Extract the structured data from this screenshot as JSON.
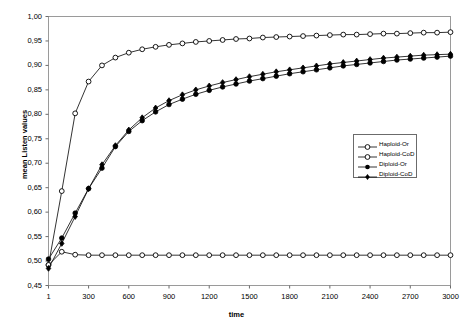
{
  "chart_data": {
    "type": "line",
    "title": "",
    "xlabel": "time",
    "ylabel": "mean Listen values",
    "xlim": [
      1,
      3000
    ],
    "ylim": [
      0.45,
      1.0
    ],
    "grid": false,
    "legend_position": "center-right",
    "xtick_labels": [
      "1",
      "300",
      "600",
      "900",
      "1200",
      "1500",
      "1800",
      "2100",
      "2400",
      "2700",
      "3000"
    ],
    "xtick_values": [
      1,
      300,
      600,
      900,
      1200,
      1500,
      1800,
      2100,
      2400,
      2700,
      3000
    ],
    "ytick_labels": [
      "0,45",
      "0,50",
      "0,55",
      "0,60",
      "0,65",
      "0,70",
      "0,75",
      "0,80",
      "0,85",
      "0,90",
      "0,95",
      "1,00"
    ],
    "ytick_values": [
      0.45,
      0.5,
      0.55,
      0.6,
      0.65,
      0.7,
      0.75,
      0.8,
      0.85,
      0.9,
      0.95,
      1.0
    ],
    "decimal_separator": ",",
    "marker_interval": 100,
    "x": [
      1,
      100,
      200,
      300,
      400,
      500,
      600,
      700,
      800,
      900,
      1000,
      1100,
      1200,
      1300,
      1400,
      1500,
      1600,
      1700,
      1800,
      1900,
      2000,
      2100,
      2200,
      2300,
      2400,
      2500,
      2600,
      2700,
      2800,
      2900,
      3000
    ],
    "series": [
      {
        "name": "Haploid-Or",
        "marker": "open-circle",
        "color": "#000000",
        "values": [
          0.492,
          0.643,
          0.802,
          0.867,
          0.9,
          0.916,
          0.926,
          0.933,
          0.938,
          0.942,
          0.945,
          0.948,
          0.95,
          0.952,
          0.954,
          0.955,
          0.957,
          0.958,
          0.959,
          0.96,
          0.961,
          0.962,
          0.963,
          0.963,
          0.964,
          0.965,
          0.965,
          0.966,
          0.967,
          0.967,
          0.968
        ]
      },
      {
        "name": "Haploid-CoD",
        "marker": "open-circle",
        "color": "#000000",
        "values": [
          0.492,
          0.519,
          0.513,
          0.512,
          0.512,
          0.512,
          0.512,
          0.512,
          0.512,
          0.512,
          0.512,
          0.512,
          0.512,
          0.512,
          0.512,
          0.512,
          0.512,
          0.512,
          0.512,
          0.512,
          0.512,
          0.512,
          0.512,
          0.512,
          0.512,
          0.512,
          0.512,
          0.512,
          0.512,
          0.512,
          0.512
        ]
      },
      {
        "name": "Diploid-Or",
        "marker": "filled-circle",
        "color": "#000000",
        "values": [
          0.504,
          0.547,
          0.598,
          0.648,
          0.69,
          0.734,
          0.765,
          0.787,
          0.805,
          0.82,
          0.831,
          0.841,
          0.849,
          0.856,
          0.862,
          0.868,
          0.873,
          0.878,
          0.883,
          0.887,
          0.891,
          0.895,
          0.899,
          0.902,
          0.905,
          0.908,
          0.911,
          0.913,
          0.915,
          0.917,
          0.919
        ]
      },
      {
        "name": "Diploid-CoD",
        "marker": "filled-diamond",
        "color": "#000000",
        "values": [
          0.485,
          0.536,
          0.591,
          0.648,
          0.697,
          0.736,
          0.768,
          0.793,
          0.813,
          0.828,
          0.84,
          0.85,
          0.858,
          0.865,
          0.871,
          0.877,
          0.882,
          0.887,
          0.891,
          0.895,
          0.899,
          0.903,
          0.906,
          0.909,
          0.912,
          0.915,
          0.917,
          0.919,
          0.921,
          0.922,
          0.923
        ]
      }
    ]
  },
  "legend": {
    "items": [
      {
        "label": "Haploid-Or"
      },
      {
        "label": "Haploid-CoD"
      },
      {
        "label": "Diploid-Or"
      },
      {
        "label": "Diploid-CoD"
      }
    ]
  }
}
